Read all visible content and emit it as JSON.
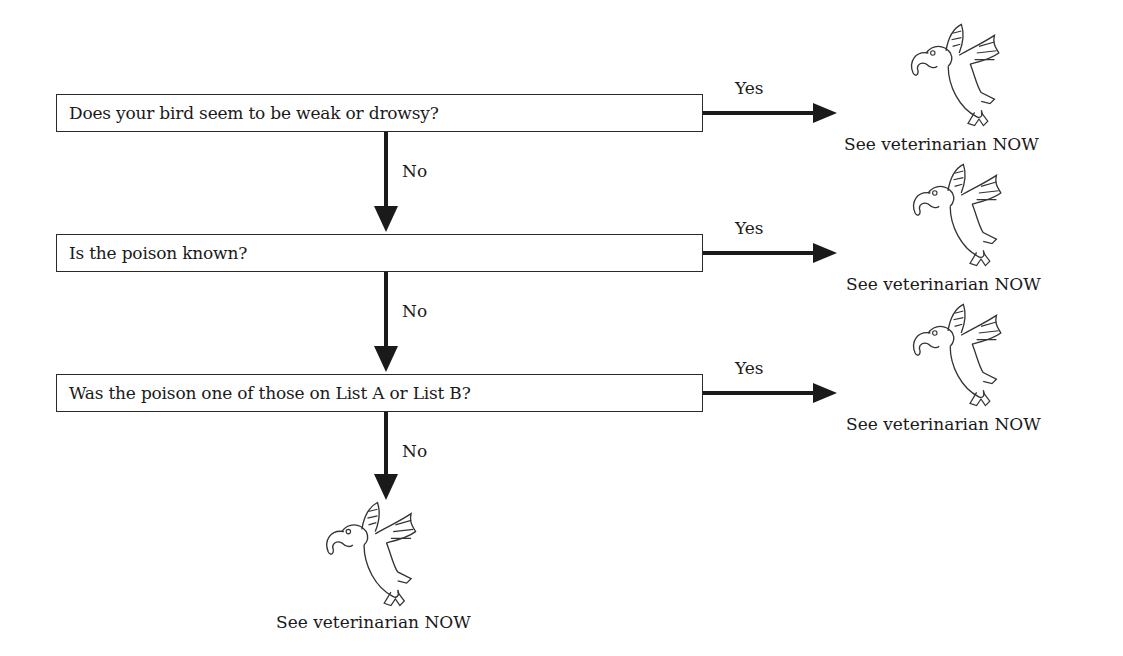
{
  "questions": [
    {
      "text": "Does your bird seem to be weak or drowsy?",
      "yes_label": "Yes",
      "no_label": "No",
      "yes_result": "See veterinarian NOW"
    },
    {
      "text": "Is the poison known?",
      "yes_label": "Yes",
      "no_label": "No",
      "yes_result": "See veterinarian NOW"
    },
    {
      "text": "Was the poison one of those on List A or List B?",
      "yes_label": "Yes",
      "no_label": "No",
      "yes_result": "See veterinarian NOW"
    }
  ],
  "final_result": "See veterinarian NOW",
  "colors": {
    "line": "#1a1a1a",
    "box_border": "#2a2a2a",
    "background": "#ffffff"
  }
}
